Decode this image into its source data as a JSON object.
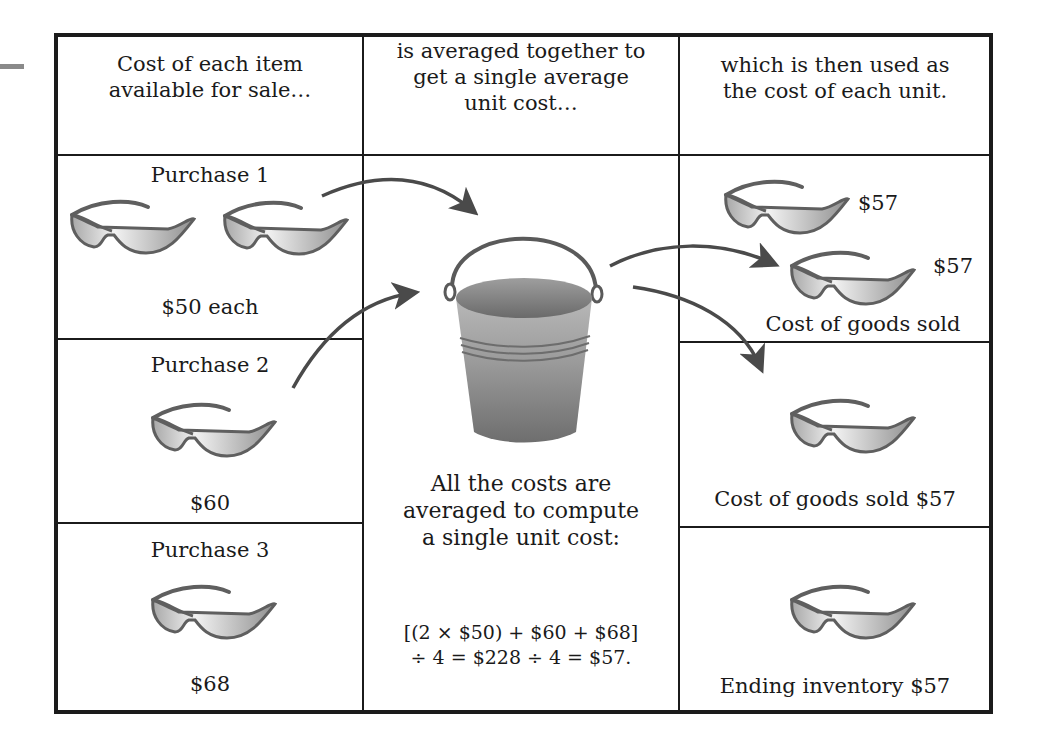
{
  "headers": {
    "col1": [
      "Cost of each item",
      "available for sale…"
    ],
    "col2": [
      "is averaged together to",
      "get a single average",
      "unit cost…"
    ],
    "col3": [
      "which is then used as",
      "the cost of each unit."
    ]
  },
  "purchases": [
    {
      "label": "Purchase 1",
      "price": "$50 each",
      "quantity": 2
    },
    {
      "label": "Purchase 2",
      "price": "$60",
      "quantity": 1
    },
    {
      "label": "Purchase 3",
      "price": "$68",
      "quantity": 1
    }
  ],
  "middle": {
    "icon": "bucket-icon",
    "explanation": [
      "All the costs are",
      "averaged to compute",
      "a single unit cost:"
    ],
    "formula": [
      "[(2 × $50) + $60 + $68]",
      "÷ 4 = $228 ÷ 4 = $57."
    ]
  },
  "results": {
    "cogs_group": {
      "unit_prices": [
        "$57",
        "$57"
      ],
      "label": "Cost of goods sold"
    },
    "cogs_single": {
      "label": "Cost of goods sold $57"
    },
    "ending_inventory": {
      "label": "Ending inventory $57"
    }
  },
  "icons": {
    "item": "sunglasses-icon",
    "flow": "arrow-icon"
  },
  "colors": {
    "border": "#1b1b1b",
    "arrow": "#4a4a4a",
    "bucket": "#8c8c8c",
    "lens": "#d8d8d8"
  }
}
